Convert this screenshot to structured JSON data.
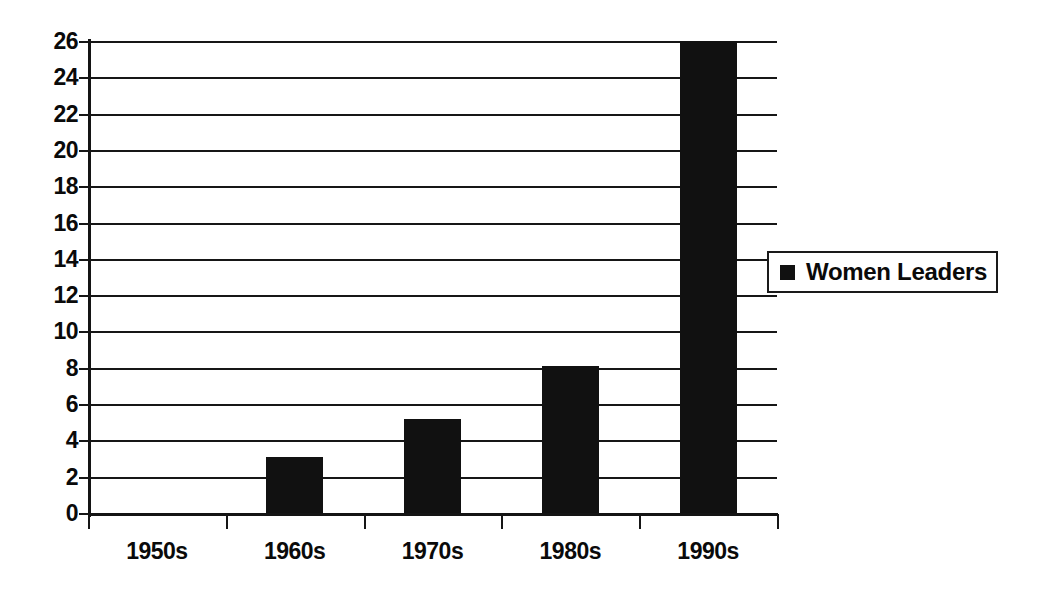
{
  "chart_data": {
    "type": "bar",
    "title": "",
    "subtitle": "",
    "xlabel": "",
    "ylabel": "",
    "categories": [
      "1950s",
      "1960s",
      "1970s",
      "1980s",
      "1990s"
    ],
    "values": [
      0,
      3,
      5,
      8,
      26
    ],
    "series": [
      {
        "name": "Women Leaders",
        "values": [
          0,
          3,
          5,
          8,
          26
        ],
        "color": "#111111"
      }
    ],
    "ylim": [
      0,
      26
    ],
    "ytick_step": 2,
    "ytick_labels": [
      "26",
      "24",
      "22",
      "20",
      "18",
      "16",
      "14",
      "12",
      "10",
      "8",
      "6",
      "4",
      "2",
      "0"
    ],
    "ytick_values": [
      26,
      24,
      22,
      20,
      18,
      16,
      14,
      12,
      10,
      8,
      6,
      4,
      2,
      0
    ],
    "grid": true,
    "grid_axis": "y",
    "legend": {
      "position": "right",
      "entries": [
        {
          "label": "Women Leaders",
          "marker": "square-marker",
          "color": "#111111"
        }
      ]
    },
    "axis_color": "#141414",
    "grid_color": "#161616",
    "background": "#ffffff"
  }
}
